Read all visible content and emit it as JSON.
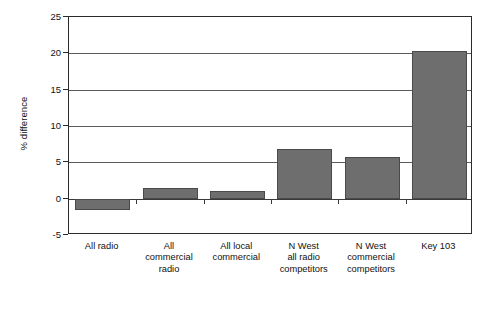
{
  "chart_data": {
    "type": "bar",
    "title": "",
    "xlabel": "",
    "ylabel": "% difference",
    "ylim": [
      -5,
      25
    ],
    "ytick_step": 5,
    "yticks": [
      -5,
      0,
      5,
      10,
      15,
      20,
      25
    ],
    "ytick_labels": [
      "-5",
      "0",
      "5",
      "10",
      "15",
      "20",
      "25"
    ],
    "grid": true,
    "legend": "none",
    "bar_color": "#6e6e6e",
    "bar_edge_color": "#4a4a4a",
    "axis_color": "#2b2b2b",
    "categories": [
      "All radio",
      "All commercial radio",
      "All local commercial",
      "N West all radio competitors",
      "N West commercial competitors",
      "Key 103"
    ],
    "category_label_lines": [
      [
        "All radio"
      ],
      [
        "All",
        "commercial",
        "radio"
      ],
      [
        "All local",
        "commercial"
      ],
      [
        "N West",
        "all radio",
        "competitors"
      ],
      [
        "N West",
        "commercial",
        "competitors"
      ],
      [
        "Key 103"
      ]
    ],
    "values": [
      -1.5,
      1.5,
      1.1,
      6.8,
      5.7,
      20.3
    ]
  },
  "caption": {
    "text": ""
  }
}
